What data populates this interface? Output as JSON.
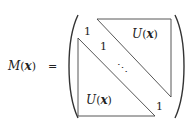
{
  "equation": {
    "lhs": {
      "fn": "M",
      "open": "(",
      "var": "x",
      "close": ")"
    },
    "equals": "=",
    "matrix": {
      "diag_top": "1",
      "diag_second": "1",
      "diag_dots": "⋱",
      "diag_last": "1",
      "upper_block": {
        "fn": "U",
        "open": "(",
        "var": "x",
        "close": ")"
      },
      "lower_block": {
        "fn": "U",
        "open": "(",
        "var": "x",
        "close": ")"
      }
    }
  }
}
